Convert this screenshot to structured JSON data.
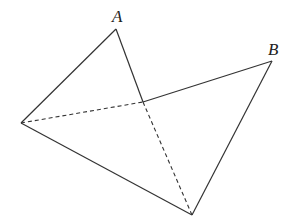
{
  "diagram": {
    "type": "geometry-figure",
    "labels": {
      "A": "A",
      "B": "B"
    },
    "points": {
      "A": [
        116,
        29
      ],
      "B": [
        272,
        61
      ],
      "L": [
        21,
        123
      ],
      "D": [
        192,
        215
      ],
      "M": [
        143,
        102
      ]
    },
    "solid_edges": [
      [
        "L",
        "A"
      ],
      [
        "A",
        "M"
      ],
      [
        "M",
        "B"
      ],
      [
        "B",
        "D"
      ],
      [
        "L",
        "D"
      ]
    ],
    "dashed_edges": [
      [
        "L",
        "M"
      ],
      [
        "M",
        "D"
      ]
    ]
  }
}
